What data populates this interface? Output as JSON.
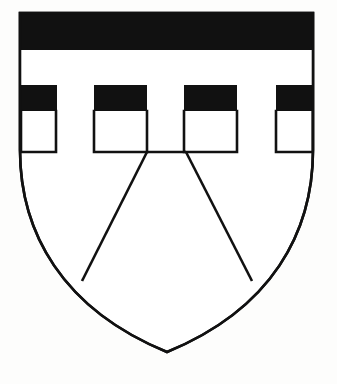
{
  "image": {
    "kind": "heraldic-coat-of-arms",
    "title": "Coat of arms",
    "description": "Shield bearing a black chief embattled-counter-embattled above a plain field, with a chevron outlined in the base",
    "width": 337,
    "height": 384,
    "background_color": "#fdfdfc"
  },
  "colors": {
    "tincture_sable": "#111111",
    "tincture_argent": "#ffffff",
    "outline": "#111111",
    "background": "#fdfdfc"
  },
  "shield": {
    "name": "escutcheon",
    "outline_width": 2.6,
    "top_y": 13,
    "left_x": 20,
    "right_x": 313,
    "point_x": 167,
    "point_y": 352,
    "fill": "#ffffff",
    "path": "M 20,13 L 313,13 L 313,150 C 313,232 272,309 167,352 C 62,309 20,232 20,150 Z"
  },
  "charges": [
    {
      "name": "chief-sable-upper-bar",
      "blazon": "chief sable",
      "fill": "#111111",
      "rect": {
        "x": 20,
        "y": 13,
        "width": 293,
        "height": 37
      }
    },
    {
      "name": "fess-argent-middle-stripe",
      "blazon": "argent stripe",
      "fill": "#ffffff",
      "rect": {
        "x": 20,
        "y": 50,
        "width": 293,
        "height": 35
      }
    }
  ],
  "embattlements": {
    "name": "embattled-band",
    "blazon": "embattled counter-embattled sable",
    "fill": "#111111",
    "band_top_y": 85,
    "band_bottom_y": 111,
    "merlon_bottom_y": 152,
    "blocks": [
      {
        "name": "merlon-1",
        "x": 20,
        "width": 37
      },
      {
        "name": "merlon-2",
        "x": 94,
        "width": 53
      },
      {
        "name": "merlon-3",
        "x": 184,
        "width": 53
      },
      {
        "name": "merlon-4",
        "x": 276,
        "width": 37
      }
    ],
    "embrasures": [
      {
        "name": "embrasure-1",
        "x": 57,
        "width": 37
      },
      {
        "name": "embrasure-2",
        "x": 147,
        "width": 37
      },
      {
        "name": "embrasure-3",
        "x": 237,
        "width": 39
      }
    ]
  },
  "chevron": {
    "name": "chevron-outline",
    "blazon": "chevron",
    "fill": "none",
    "stroke": "#111111",
    "stroke_width": 2.6,
    "apex_left_x": 147,
    "apex_right_x": 186,
    "apex_y": 152,
    "left_foot_x": 82,
    "left_foot_y": 281,
    "right_foot_x": 252,
    "right_foot_y": 281,
    "left_path": "M 147,152 L 82,281",
    "right_path": "M 186,152 L 252,281"
  },
  "labels": {
    "figure_caption": "",
    "alt_text": "Coat of arms: shield with embattled chief and chevron"
  }
}
